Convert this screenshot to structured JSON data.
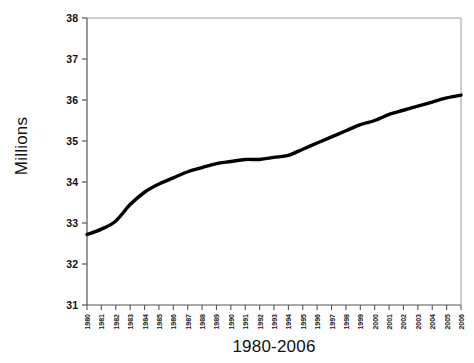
{
  "chart_data": {
    "type": "line",
    "title": "",
    "xlabel": "1980-2006",
    "ylabel": "Millions",
    "ylim": [
      31,
      38
    ],
    "yticks": [
      31,
      32,
      33,
      34,
      35,
      36,
      37,
      38
    ],
    "grid": false,
    "legend": null,
    "line_color": "#000000",
    "categories": [
      "1980",
      "1981",
      "1982",
      "1983",
      "1984",
      "1985",
      "1986",
      "1987",
      "1988",
      "1989",
      "1990",
      "1991",
      "1992",
      "1993",
      "1994",
      "1995",
      "1996",
      "1997",
      "1998",
      "1999",
      "2000",
      "2001",
      "2002",
      "2003",
      "2004",
      "2005",
      "2006"
    ],
    "values": [
      32.72,
      32.85,
      33.05,
      33.45,
      33.75,
      33.95,
      34.1,
      34.25,
      34.35,
      34.45,
      34.5,
      34.55,
      34.55,
      34.6,
      34.65,
      34.8,
      34.95,
      35.1,
      35.25,
      35.4,
      35.5,
      35.65,
      35.75,
      35.85,
      35.95,
      36.05,
      36.12
    ],
    "series": [
      {
        "name": "Millions",
        "values": [
          32.72,
          32.85,
          33.05,
          33.45,
          33.75,
          33.95,
          34.1,
          34.25,
          34.35,
          34.45,
          34.5,
          34.55,
          34.55,
          34.6,
          34.65,
          34.8,
          34.95,
          35.1,
          35.25,
          35.4,
          35.5,
          35.65,
          35.75,
          35.85,
          35.95,
          36.05,
          36.12
        ]
      }
    ]
  }
}
